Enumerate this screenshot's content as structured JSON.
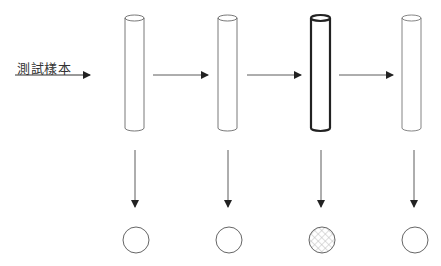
{
  "diagram": {
    "input_label": "測試樣本",
    "columns": [
      {
        "id": 1,
        "tube_style": "thin",
        "result": "empty"
      },
      {
        "id": 2,
        "tube_style": "thin",
        "result": "empty"
      },
      {
        "id": 3,
        "tube_style": "bold",
        "result": "hatched"
      },
      {
        "id": 4,
        "tube_style": "thin",
        "result": "empty"
      }
    ],
    "colors": {
      "line": "#333333",
      "hatch": "#bbbbbb",
      "background": "#ffffff"
    }
  }
}
